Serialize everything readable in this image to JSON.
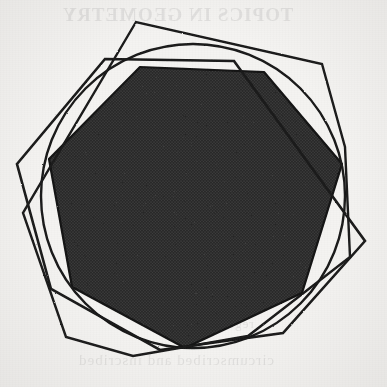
{
  "figure": {
    "caption_ghost_top": "TOPICS IN GEOMETRY",
    "caption_ghost_bottom": "circumscribed and inscribed",
    "caption_ghost_mid": "regular polygons",
    "background_color": "#f4f3f1",
    "ink_color": "#1a1a1a",
    "fill_color": "#333333",
    "stroke_width": 2.6,
    "width": 387,
    "height": 387
  },
  "chart_data": {
    "type": "diagram",
    "xlabel": "",
    "ylabel": "",
    "grid": false,
    "legend": "none",
    "axis_ranges": {
      "x": [
        0,
        387
      ],
      "y": [
        0,
        387
      ]
    },
    "center": {
      "x": 193,
      "y": 196
    },
    "circle": {
      "name": "circumcircle",
      "cx": 193,
      "cy": 196,
      "r": 152,
      "stroke": "#1a1a1a",
      "stroke_width": 2.4,
      "fill": "none"
    },
    "shapes": [
      {
        "name": "inscribed-heptagon",
        "sides": 7,
        "rotation_deg": -12,
        "circumradius": 152,
        "fill": "#333333",
        "stroke": "#141414",
        "stroke_width": 2.2,
        "vertices": [
          [
            342,
            164
          ],
          [
            302,
            293
          ],
          [
            185,
            348
          ],
          [
            72,
            287
          ],
          [
            49,
            159
          ],
          [
            140,
            67
          ],
          [
            264,
            72
          ]
        ]
      },
      {
        "name": "circumscribed-heptagon",
        "sides": 7,
        "rotation_deg": 14,
        "circumradius": 176,
        "fill": "none",
        "stroke": "#1a1a1a",
        "stroke_width": 2.6,
        "vertices": [
          [
            365,
            241
          ],
          [
            283,
            333
          ],
          [
            160,
            350
          ],
          [
            51,
            289
          ],
          [
            17,
            164
          ],
          [
            105,
            59
          ],
          [
            234,
            61
          ]
        ]
      },
      {
        "name": "circumscribed-heptagon-secondary",
        "sides": 7,
        "rotation_deg": -2,
        "circumradius": 172,
        "fill": "none",
        "stroke": "#1a1a1a",
        "stroke_width": 2.4,
        "vertices": [
          [
            345,
            147
          ],
          [
            350,
            257
          ],
          [
            248,
            336
          ],
          [
            133,
            356
          ],
          [
            66,
            337
          ],
          [
            23,
            213
          ],
          [
            136,
            22
          ],
          [
            322,
            64
          ]
        ]
      }
    ],
    "values": [
      7,
      7,
      1
    ],
    "categories": [
      "inscribed heptagon",
      "circumscribed heptagon",
      "circle"
    ]
  }
}
